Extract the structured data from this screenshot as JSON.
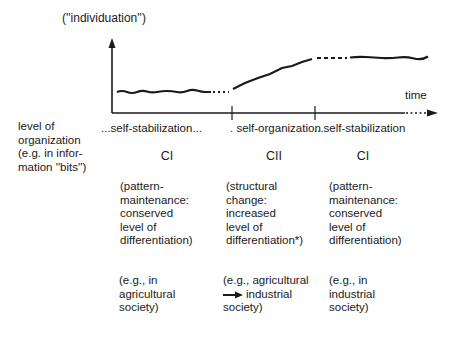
{
  "diagram": {
    "y_axis_label": "(''individuation'')",
    "x_axis_label": "time",
    "left_label": [
      "level of",
      "organization",
      "(e.g. in infor-",
      "mation ''bits'')"
    ],
    "phases": [
      {
        "process": "...self-stabilization...",
        "code": "CI",
        "description": [
          "(pattern-",
          "maintenance:",
          "conserved",
          "level of",
          "differentiation)"
        ],
        "example": [
          "(e.g., in",
          "agricultural",
          "society)"
        ]
      },
      {
        "process": "self-organization",
        "code": "CII",
        "description": [
          "(structural",
          "change:",
          "increased",
          "level of",
          "differentiation*)"
        ],
        "example": [
          "(e.g., agricultural",
          "industrial",
          "society)"
        ],
        "example_arrow": "right-arrow"
      },
      {
        "process": "...self-stabilization",
        "code": "CI",
        "description": [
          "(pattern-",
          "maintenance:",
          "conserved",
          "level of",
          "differentiation)"
        ],
        "example": [
          "(e.g., in",
          "industrial",
          "society)"
        ]
      }
    ],
    "colors": {
      "ink": "#1a1a1a",
      "background": "#ffffff"
    }
  }
}
